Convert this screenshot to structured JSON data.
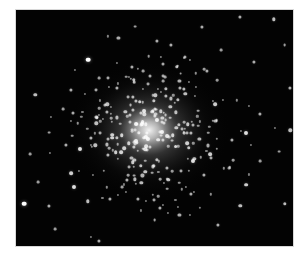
{
  "image": {
    "subject": "globular star cluster",
    "description": "Black-and-white telescope photograph of a dense globular star cluster with a bright core and scattered field stars",
    "colors": {
      "background": "#030303",
      "star": "#ffffff",
      "core_glow": "#f2f2f2",
      "page": "#ffffff"
    },
    "cluster_center": {
      "x": 0.48,
      "y": 0.51
    },
    "field_stars": [
      [
        0.26,
        0.21,
        1.0
      ],
      [
        0.33,
        0.4,
        0.6
      ],
      [
        0.51,
        0.13,
        0.5
      ],
      [
        0.81,
        0.03,
        0.5
      ],
      [
        0.93,
        0.04,
        0.6
      ],
      [
        0.86,
        0.22,
        0.5
      ],
      [
        0.69,
        0.26,
        0.5
      ],
      [
        0.72,
        0.4,
        0.7
      ],
      [
        0.59,
        0.3,
        0.5
      ],
      [
        0.42,
        0.24,
        0.5
      ],
      [
        0.2,
        0.34,
        0.5
      ],
      [
        0.07,
        0.36,
        0.6
      ],
      [
        0.29,
        0.48,
        0.6
      ],
      [
        0.23,
        0.59,
        0.8
      ],
      [
        0.2,
        0.69,
        0.7
      ],
      [
        0.21,
        0.75,
        0.8
      ],
      [
        0.03,
        0.82,
        1.0
      ],
      [
        0.12,
        0.83,
        0.5
      ],
      [
        0.26,
        0.81,
        0.6
      ],
      [
        0.34,
        0.8,
        0.5
      ],
      [
        0.44,
        0.8,
        0.5
      ],
      [
        0.52,
        0.84,
        0.5
      ],
      [
        0.59,
        0.87,
        0.5
      ],
      [
        0.64,
        0.64,
        0.8
      ],
      [
        0.7,
        0.61,
        0.7
      ],
      [
        0.78,
        0.55,
        0.5
      ],
      [
        0.83,
        0.52,
        0.8
      ],
      [
        0.88,
        0.44,
        0.5
      ],
      [
        0.99,
        0.51,
        0.6
      ],
      [
        0.97,
        0.82,
        0.6
      ],
      [
        0.83,
        0.74,
        0.7
      ],
      [
        0.81,
        0.83,
        0.6
      ],
      [
        0.73,
        0.91,
        0.5
      ],
      [
        0.63,
        0.78,
        0.5
      ],
      [
        0.5,
        0.89,
        0.4
      ],
      [
        0.3,
        0.98,
        0.5
      ],
      [
        0.14,
        0.93,
        0.4
      ],
      [
        0.12,
        0.52,
        0.4
      ],
      [
        0.18,
        0.57,
        0.5
      ],
      [
        0.37,
        0.12,
        0.5
      ],
      [
        0.43,
        0.07,
        0.4
      ],
      [
        0.67,
        0.07,
        0.5
      ],
      [
        0.74,
        0.17,
        0.4
      ],
      [
        0.97,
        0.15,
        0.4
      ],
      [
        0.99,
        0.33,
        0.5
      ],
      [
        0.95,
        0.6,
        0.4
      ],
      [
        0.88,
        0.64,
        0.4
      ],
      [
        0.56,
        0.15,
        0.5
      ],
      [
        0.61,
        0.2,
        0.5
      ],
      [
        0.3,
        0.29,
        0.4
      ],
      [
        0.17,
        0.42,
        0.4
      ],
      [
        0.05,
        0.61,
        0.4
      ],
      [
        0.08,
        0.73,
        0.4
      ],
      [
        0.4,
        0.72,
        0.5
      ],
      [
        0.45,
        0.66,
        0.6
      ],
      [
        0.55,
        0.72,
        0.6
      ],
      [
        0.68,
        0.7,
        0.5
      ],
      [
        0.77,
        0.67,
        0.4
      ],
      [
        0.72,
        0.47,
        0.5
      ],
      [
        0.58,
        0.24,
        0.6
      ]
    ],
    "cluster_star_count": 260,
    "cluster_spread": 0.16
  }
}
